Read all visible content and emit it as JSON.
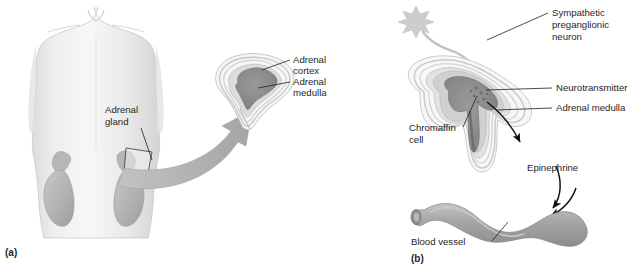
{
  "figure": {
    "background_color": "#ffffff",
    "text_color": "#262626",
    "panels": [
      {
        "id": "a",
        "marker": "(a)",
        "description": "Human torso showing location of adrenal glands atop the kidneys with an enlarged cross-section of an adrenal gland"
      },
      {
        "id": "b",
        "marker": "(b)",
        "description": "Cross-section of adrenal gland with sympathetic preganglionic neuron releasing neurotransmitter onto chromaffin cells which secrete epinephrine into a blood vessel"
      }
    ]
  },
  "panel_a": {
    "marker": "(a)",
    "labels": {
      "adrenal_gland": {
        "line1": "Adrenal",
        "line2": "gland"
      },
      "adrenal_cortex": {
        "line1": "Adrenal",
        "line2": "cortex"
      },
      "adrenal_medulla": {
        "line1": "Adrenal",
        "line2": "medulla"
      }
    },
    "parts": {
      "torso": "human-torso-outline",
      "left_kidney": "kidney",
      "right_kidney": "kidney",
      "left_adrenal": "adrenal-gland",
      "right_adrenal": "adrenal-gland",
      "magnify_arrow": "curved-magnification-arrow",
      "gland_section": "adrenal-gland-cross-section"
    },
    "colors": {
      "skin": "#ededed",
      "skin_shadow": "#d8d8d8",
      "organ": "#bdbdbd",
      "organ_dark": "#a8a8a8",
      "arrow": "#b0b0b0",
      "cortex_band_light": "#f2f2f2",
      "cortex_band_mid": "#cfcfcf",
      "medulla": "#8a8a8a"
    }
  },
  "panel_b": {
    "marker": "(b)",
    "labels": {
      "sympathetic_neuron": {
        "line1": "Sympathetic",
        "line2": "preganglionic",
        "line3": "neuron"
      },
      "neurotransmitter": "Neurotransmitter",
      "adrenal_medulla": "Adrenal medulla",
      "chromaffin_cell": {
        "line1": "Chromaffin",
        "line2": "cell"
      },
      "epinephrine": "Epinephrine",
      "blood_vessel": "Blood vessel"
    },
    "parts": {
      "neuron_soma": "neuron-cell-body-star",
      "axon": "axon-fiber",
      "gland_section": "adrenal-gland-cross-section",
      "medulla_core": "adrenal-medulla-region",
      "vessel": "blood-vessel-tube",
      "arrow_epinephrine": "epinephrine-release-arrow",
      "arrow_into_vessel": "epinephrine-into-vessel-arrow"
    },
    "colors": {
      "neuron": "#c9c9c9",
      "axon": "#c4c4c4",
      "cortex_band_light": "#f4f4f4",
      "cortex_band_mid": "#d2d2d2",
      "cortex_band_dark": "#b4b4b4",
      "medulla": "#8f8f8f",
      "vessel": "#9e9e9e",
      "vessel_highlight": "#c2c2c2",
      "arrow": "#111111"
    }
  }
}
